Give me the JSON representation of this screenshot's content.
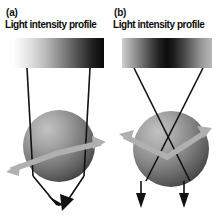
{
  "figure": {
    "background_color": "#ffffff",
    "width": 217,
    "height": 224
  },
  "panels": [
    {
      "id": "a",
      "letter": "(a)",
      "caption": "Light intensity profile",
      "profile": {
        "type": "linear-gradient",
        "description": "bright on left fading to dark on right",
        "start_color": "#fdfdfd",
        "end_color": "#0a0a0a",
        "x": 14,
        "y": 38,
        "width": 90,
        "height": 30
      },
      "sphere": {
        "center_x": 59,
        "center_y": 146,
        "radius": 36,
        "highlight_color": "#b5b5b5",
        "shadow_color": "#4a4a4a"
      },
      "incident_rays": {
        "count": 2,
        "description": "two near-vertical parallel rays entering sphere",
        "color": "#111111"
      },
      "exit_rays": {
        "count": 2,
        "description": "two rays converging to a single point below sphere",
        "color": "#111111",
        "converge_x": 61,
        "converge_y": 211
      },
      "force_arrow": {
        "description": "gray double-headed chevron arrow tilted up to the right",
        "color": "#b0b0b0",
        "direction": "bidirectional"
      }
    },
    {
      "id": "b",
      "letter": "(b)",
      "caption": "Light intensity profile",
      "profile": {
        "type": "linear-gradient",
        "description": "dark at center fading to bright at both edges",
        "start_color": "#cfcfcf",
        "center_color": "#0c0c0c",
        "end_color": "#b9b9b9",
        "x": 122,
        "y": 38,
        "width": 90,
        "height": 30
      },
      "sphere": {
        "center_x": 171,
        "center_y": 149,
        "radius": 38,
        "highlight_color": "#b5b5b5",
        "shadow_color": "#4a4a4a"
      },
      "incident_rays": {
        "count": 2,
        "description": "two rays crossing in an X above the sphere",
        "color": "#111111",
        "cross_x": 167,
        "cross_y": 98
      },
      "exit_rays": {
        "count": 2,
        "description": "two parallel vertical arrows pointing down below sphere",
        "color": "#111111"
      },
      "force_arrow": {
        "description": "gray double-headed chevron arrow tilted up to the right",
        "color": "#b0b0b0",
        "direction": "bidirectional"
      }
    }
  ],
  "colors": {
    "ray": "#111111",
    "force_arrow": "#b0b0b0",
    "text": "#0d0d0d",
    "background": "#ffffff"
  }
}
